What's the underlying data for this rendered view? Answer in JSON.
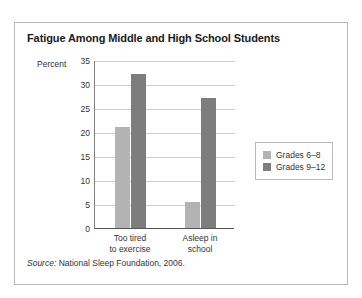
{
  "figure": {
    "title": "Fatigue Among Middle and High School Students",
    "source_label": "Source:",
    "source_text": "National Sleep Foundation, 2006."
  },
  "chart_data": {
    "type": "bar",
    "title": "Fatigue Among Middle and High School Students",
    "xlabel": "",
    "ylabel": "Percent",
    "ylim": [
      0,
      35
    ],
    "yticks": [
      0,
      5,
      10,
      15,
      20,
      25,
      30,
      35
    ],
    "grid": true,
    "legend_position": "right",
    "categories": [
      "Too tired to exercise",
      "Asleep in school"
    ],
    "category_lines": [
      [
        "Too tired",
        "to exercise"
      ],
      [
        "Asleep in",
        "school"
      ]
    ],
    "series": [
      {
        "name": "Grades 6–8",
        "color": "#b3b3b3",
        "values": [
          21,
          5.5
        ]
      },
      {
        "name": "Grades 9–12",
        "color": "#7d7d7d",
        "values": [
          32,
          27
        ]
      }
    ]
  }
}
